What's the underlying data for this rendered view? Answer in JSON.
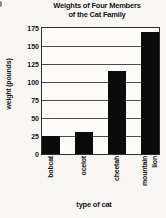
{
  "chart_data": {
    "type": "bar",
    "title": "Weights of Four Members of the Cat Family",
    "title_lines": [
      "Weights of Four Members",
      "of the Cat Family"
    ],
    "categories": [
      "bobcat",
      "ocelot",
      "cheetah",
      "mountain lion"
    ],
    "values": [
      25,
      30,
      115,
      170
    ],
    "xlabel": "type of cat",
    "ylabel": "weight (pounds)",
    "ylim": [
      0,
      175
    ],
    "yticks": [
      0,
      25,
      50,
      75,
      100,
      125,
      150,
      175
    ],
    "grid": true,
    "legend": false,
    "bar_color": "#0b0b0b",
    "frame_color": "#2e2e2e",
    "gridline_color": "#4d4d4d"
  }
}
